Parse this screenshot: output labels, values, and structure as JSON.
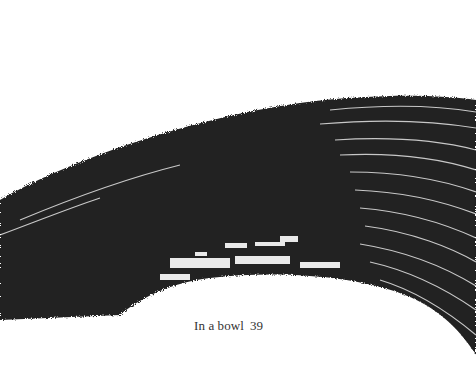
{
  "page": {
    "illustration": {
      "type": "ink-brush-stroke",
      "description": "Large curved black sumi-e brush stroke arcing from left edge up to upper right",
      "ink_color": "#222222",
      "background_color": "#ffffff"
    },
    "footer": {
      "running_title": "In a bowl",
      "page_number": "39"
    }
  }
}
